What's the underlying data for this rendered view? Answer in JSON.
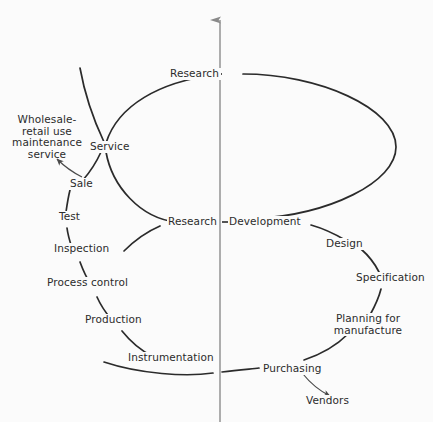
{
  "diagram": {
    "type": "process-cycle",
    "axis": {
      "name": "vertical-axis-arrow",
      "direction": "up"
    },
    "colors": {
      "ink": "#2b2b2b",
      "axis": "#8a8a8a",
      "background": "#fbfbfb"
    },
    "nodes": [
      {
        "id": "research-top",
        "label": "Research"
      },
      {
        "id": "service",
        "label": "Service"
      },
      {
        "id": "wholesale",
        "label": "Wholesale-\nretail use\nmaintenance\nservice"
      },
      {
        "id": "sale",
        "label": "Sale"
      },
      {
        "id": "test",
        "label": "Test"
      },
      {
        "id": "inspection",
        "label": "Inspection"
      },
      {
        "id": "process-control",
        "label": "Process control"
      },
      {
        "id": "production",
        "label": "Production"
      },
      {
        "id": "instrumentation",
        "label": "Instrumentation"
      },
      {
        "id": "purchasing",
        "label": "Purchasing"
      },
      {
        "id": "vendors",
        "label": "Vendors"
      },
      {
        "id": "planning",
        "label": "Planning for\nmanufacture"
      },
      {
        "id": "specification",
        "label": "Specification"
      },
      {
        "id": "design",
        "label": "Design"
      },
      {
        "id": "research-mid",
        "label": "Research"
      },
      {
        "id": "development",
        "label": "Development"
      }
    ],
    "labels": {
      "research_top": "Research",
      "service": "Service",
      "wholesale_l1": "Wholesale-",
      "wholesale_l2": "retail use",
      "wholesale_l3": "maintenance",
      "wholesale_l4": "service",
      "sale": "Sale",
      "test": "Test",
      "inspection": "Inspection",
      "process_control": "Process control",
      "production": "Production",
      "instrumentation": "Instrumentation",
      "purchasing": "Purchasing",
      "vendors": "Vendors",
      "planning_l1": "Planning for",
      "planning_l2": "manufacture",
      "specification": "Specification",
      "design": "Design",
      "research_mid": "Research",
      "development": "Development"
    }
  }
}
